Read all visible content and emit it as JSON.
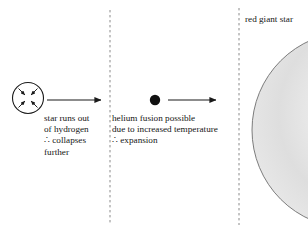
{
  "diagram": {
    "background_color": "#ffffff",
    "ink_color": "#1a1a1a",
    "divider_color": "#8a8a8a",
    "giant_fill_color": "#e2e2e2",
    "giant_outline_color": "#6e6e6e",
    "stage_width": 308,
    "stage_height": 225
  },
  "stage1": {
    "name": "collapsing star",
    "circle": {
      "cx": 28,
      "cy": 98,
      "r": 15.5,
      "stroke": "#1a1a1a"
    },
    "inward_arrows_count": 4,
    "caption_lines": [
      "star runs out",
      "of hydrogen",
      "∴ collapses",
      "further"
    ],
    "caption_text": "star runs out\nof hydrogen\n∴ collapses\nfurther"
  },
  "arrow1": {
    "name": "arrow-stage1-to-stage2",
    "x1": 47,
    "x2": 101,
    "y": 100
  },
  "divider1": {
    "name": "dashed-divider-left",
    "x": 110,
    "y1": 10,
    "y2": 225
  },
  "stage2": {
    "name": "helium core dot",
    "dot": {
      "cx": 155,
      "cy": 100,
      "r": 5.2,
      "fill": "#111111"
    },
    "caption_lines": [
      "helium fusion possible",
      "due to increased temperature",
      "∴ expansion"
    ],
    "caption_text": "helium fusion possible\ndue to increased temperature\n∴ expansion"
  },
  "arrow2": {
    "name": "arrow-stage2-to-stage3",
    "x1": 168,
    "x2": 216,
    "y": 100
  },
  "divider2": {
    "name": "dashed-divider-right",
    "x": 239,
    "y1": 8,
    "y2": 225
  },
  "stage3": {
    "name": "red giant star",
    "label": "red giant star",
    "sphere": {
      "cx": 350,
      "cy": 130,
      "rx": 98,
      "ry": 98
    }
  }
}
